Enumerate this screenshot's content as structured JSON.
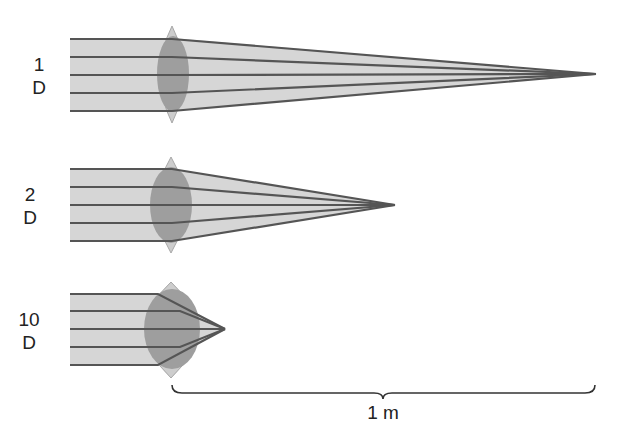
{
  "colors": {
    "beam_fill": "#d6d6d6",
    "ray": "#555555",
    "lens_outer": "#cfcfcf",
    "lens_inner": "#9c9c9c",
    "text": "#222222"
  },
  "lenses": [
    {
      "power_number": "1",
      "power_unit": "D",
      "focal_label": "1 m"
    },
    {
      "power_number": "2",
      "power_unit": "D",
      "focal_label": "0.5 m"
    },
    {
      "power_number": "10",
      "power_unit": "D",
      "focal_label": "0.1 m"
    }
  ],
  "scale_bar": {
    "label": "1 m"
  }
}
